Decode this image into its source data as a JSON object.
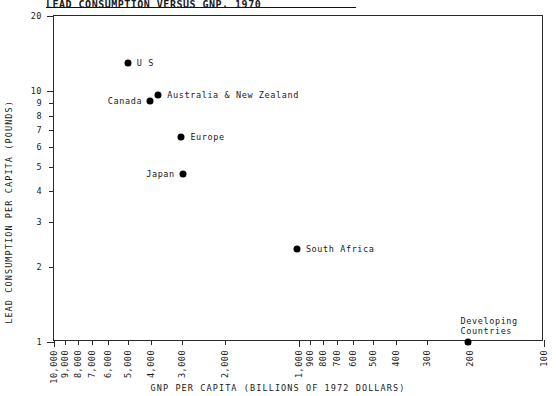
{
  "title": "LEAD CONSUMPTION VERSUS GNP, 1970",
  "axes": {
    "ylabel": "LEAD CONSUMPTION PER CAPITA (POUNDS)",
    "xlabel": "GNP PER CAPITA (BILLIONS OF 1972 DOLLARS)",
    "yticks": [
      "1",
      "2",
      "3",
      "4",
      "5",
      "6",
      "7",
      "8",
      "9",
      "10",
      "20"
    ],
    "xticks": [
      "10,000",
      "9,000",
      "8,000",
      "7,000",
      "6,000",
      "5,000",
      "4,000",
      "3,000",
      "2,000",
      "1,000",
      "900",
      "800",
      "700",
      "600",
      "500",
      "400",
      "300",
      "200",
      "100"
    ]
  },
  "chart_data": {
    "type": "scatter",
    "title": "LEAD CONSUMPTION VERSUS GNP, 1970",
    "xlabel": "GNP PER CAPITA (BILLIONS OF 1972 DOLLARS)",
    "ylabel": "LEAD CONSUMPTION PER CAPITA (POUNDS)",
    "xscale": "log",
    "yscale": "log",
    "xlim": [
      10000,
      100
    ],
    "ylim": [
      1,
      20
    ],
    "x_reversed": true,
    "grid": false,
    "legend": "none",
    "points": [
      {
        "label": "U S",
        "x": 5000,
        "y": 13.0,
        "label_side": "right",
        "lines": [
          "U S"
        ]
      },
      {
        "label": "Canada",
        "x": 4050,
        "y": 9.2,
        "label_side": "left",
        "lines": [
          "Canada"
        ]
      },
      {
        "label": "Australia & New Zealand",
        "x": 3750,
        "y": 9.7,
        "label_side": "right",
        "lines": [
          "Australia & New Zealand"
        ]
      },
      {
        "label": "Europe",
        "x": 3020,
        "y": 6.6,
        "label_side": "right",
        "lines": [
          "Europe"
        ]
      },
      {
        "label": "Japan",
        "x": 2980,
        "y": 4.7,
        "label_side": "left",
        "lines": [
          "Japan"
        ]
      },
      {
        "label": "South Africa",
        "x": 1020,
        "y": 2.35,
        "label_side": "right",
        "lines": [
          "South Africa"
        ]
      },
      {
        "label": "Developing Countries",
        "x": 205,
        "y": 1.0,
        "label_side": "above",
        "lines": [
          "Developing",
          "Countries"
        ]
      }
    ]
  }
}
